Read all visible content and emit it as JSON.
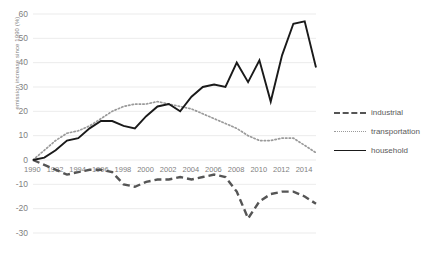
{
  "chart_data": {
    "type": "line",
    "title": "",
    "xlabel": "",
    "ylabel": "emission increase since 1990 (%)",
    "ylim": [
      -30,
      60
    ],
    "yticks": [
      60,
      50,
      40,
      30,
      20,
      10,
      0,
      -10,
      -20,
      -30
    ],
    "ytick_labels": [
      "60",
      "50",
      "40",
      "30",
      "20",
      "10",
      "0",
      "-10",
      "-20",
      "-30"
    ],
    "grid": true,
    "legend_position": "right",
    "x": [
      1990,
      1991,
      1992,
      1993,
      1994,
      1995,
      1996,
      1997,
      1998,
      1999,
      2000,
      2001,
      2002,
      2003,
      2004,
      2005,
      2006,
      2007,
      2008,
      2009,
      2010,
      2011,
      2012,
      2013,
      2014,
      2015
    ],
    "xtick_labels": [
      "1990",
      "1992",
      "1994",
      "1996",
      "1998",
      "2000",
      "2002",
      "2004",
      "2006",
      "2008",
      "2010",
      "2012",
      "2014"
    ],
    "xticks": [
      1990,
      1992,
      1994,
      1996,
      1998,
      2000,
      2002,
      2004,
      2006,
      2008,
      2010,
      2012,
      2014
    ],
    "series": [
      {
        "name": "industrial",
        "style": "dashed",
        "color": "#555555",
        "values": [
          0,
          -2,
          -4,
          -6,
          -5,
          -4,
          -4,
          -5,
          -10,
          -11,
          -9,
          -8,
          -8,
          -7,
          -8,
          -7,
          -6,
          -7,
          -13,
          -24,
          -17,
          -14,
          -13,
          -13,
          -15,
          -18
        ]
      },
      {
        "name": "transportation",
        "style": "dotted",
        "color": "#9a9a9a",
        "values": [
          0,
          4,
          8,
          11,
          12,
          14,
          17,
          20,
          22,
          23,
          23,
          24,
          23,
          22,
          21,
          19,
          17,
          15,
          13,
          10,
          8,
          8,
          9,
          9,
          6,
          3
        ]
      },
      {
        "name": "household",
        "style": "solid",
        "color": "#1a1a1a",
        "values": [
          0,
          1,
          4,
          8,
          9,
          13,
          16,
          16,
          14,
          13,
          18,
          22,
          23,
          20,
          26,
          30,
          31,
          30,
          40,
          32,
          41,
          24,
          43,
          56,
          57,
          38
        ]
      }
    ]
  }
}
